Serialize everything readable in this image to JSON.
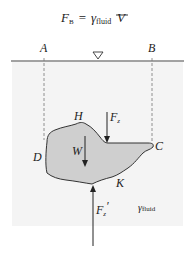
{
  "formula": {
    "lhs": "F",
    "lhs_sub": "B",
    "equals": "=",
    "gamma": "γ",
    "gamma_sub": "fluid",
    "volume_symbol": "V"
  },
  "labels": {
    "A": "A",
    "B": "B",
    "C": "C",
    "D": "D",
    "H": "H",
    "K": "K",
    "W": "W",
    "Fz": "F",
    "Fz_sub": "z",
    "Fz_prime": "F",
    "Fz_prime_sub": "z",
    "Fz_prime_mark": "′",
    "gamma_fluid": "γ",
    "gamma_fluid_sub": "fluid"
  },
  "colors": {
    "fluid": "#f4f4f4",
    "body_fill": "#cfcfcf",
    "line": "#333333",
    "dashed": "#777777"
  }
}
